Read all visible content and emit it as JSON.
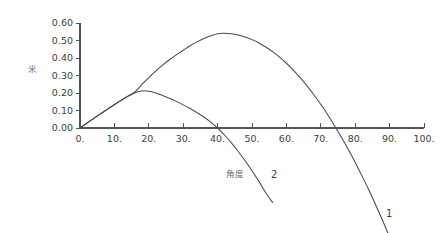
{
  "chart_data": {
    "type": "line",
    "title": "",
    "subtitle": "",
    "xlabel": "角度",
    "ylabel": "米",
    "xlim": [
      0,
      100
    ],
    "ylim": [
      0.0,
      0.6
    ],
    "grid": false,
    "legend_position": "inline-end-of-curve",
    "x_ticks": [
      "0.",
      "10.",
      "20.",
      "30.",
      "40.",
      "50.",
      "60.",
      "70.",
      "80.",
      "90.",
      "100."
    ],
    "x_tick_values": [
      0,
      10,
      20,
      30,
      40,
      50,
      60,
      70,
      80,
      90,
      100
    ],
    "y_ticks": [
      "0.00",
      "0.10",
      "0.20",
      "0.30",
      "0.40",
      "0.50",
      "0.60"
    ],
    "y_tick_values": [
      0.0,
      0.1,
      0.2,
      0.3,
      0.4,
      0.5,
      0.6
    ],
    "series": [
      {
        "name": "1",
        "label": "1",
        "color": "#4a4a4a",
        "peak_x": 40,
        "peak_y": 0.54,
        "zero_crossing_x": 71,
        "x": [
          0,
          2,
          4,
          6,
          8,
          10,
          12,
          14,
          16,
          18,
          20,
          22,
          24,
          26,
          28,
          30,
          32,
          34,
          36,
          38,
          40,
          42,
          44,
          46,
          48,
          50,
          52,
          54,
          56,
          58,
          60,
          62,
          64,
          66,
          68,
          70,
          71,
          72,
          74,
          76,
          78,
          80,
          82,
          84,
          86,
          88,
          90,
          92,
          94,
          96,
          98,
          100
        ],
        "y": [
          0.0,
          0.028,
          0.055,
          0.082,
          0.108,
          0.134,
          0.159,
          0.183,
          0.207,
          0.249,
          0.288,
          0.325,
          0.359,
          0.39,
          0.418,
          0.444,
          0.47,
          0.492,
          0.511,
          0.527,
          0.539,
          0.541,
          0.538,
          0.531,
          0.52,
          0.505,
          0.486,
          0.463,
          0.436,
          0.405,
          0.37,
          0.331,
          0.288,
          0.241,
          0.19,
          0.135,
          0.107,
          0.076,
          0.013,
          -0.053,
          -0.123,
          -0.197,
          -0.275,
          -0.356,
          -0.441,
          -0.53,
          -0.623,
          -0.72,
          -0.821,
          -0.925,
          -1.033,
          -1.145
        ]
      },
      {
        "name": "2",
        "label": "2",
        "color": "#4a4a4a",
        "peak_x": 18,
        "peak_y": 0.212,
        "zero_crossing_x": 40,
        "x": [
          0,
          2,
          4,
          6,
          8,
          10,
          12,
          14,
          16,
          18,
          20,
          22,
          24,
          26,
          28,
          30,
          32,
          34,
          36,
          38,
          40,
          42,
          44,
          46,
          48,
          50,
          52,
          54,
          56
        ],
        "y": [
          0.0,
          0.027,
          0.054,
          0.081,
          0.107,
          0.133,
          0.158,
          0.182,
          0.202,
          0.212,
          0.21,
          0.2,
          0.186,
          0.17,
          0.152,
          0.132,
          0.111,
          0.088,
          0.063,
          0.034,
          0.0,
          -0.04,
          -0.085,
          -0.134,
          -0.187,
          -0.244,
          -0.305,
          -0.37,
          -0.425
        ]
      }
    ]
  },
  "axes": {
    "y_title": "米",
    "x_title": "角度"
  }
}
